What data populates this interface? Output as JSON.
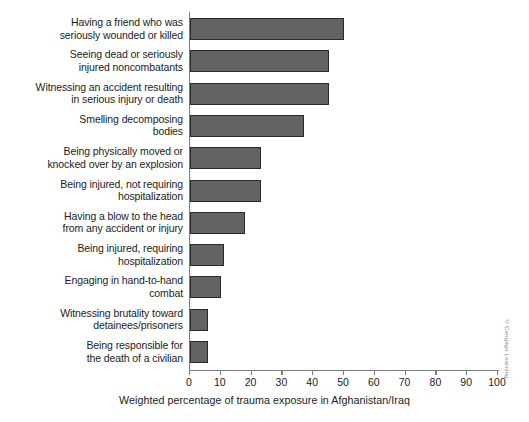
{
  "chart_data": {
    "type": "bar",
    "orientation": "horizontal",
    "title": "",
    "xlabel": "Weighted percentage of trauma exposure in Afghanistan/Iraq",
    "ylabel": "",
    "xlim": [
      0,
      100
    ],
    "xticks": [
      0,
      10,
      20,
      30,
      40,
      50,
      60,
      70,
      80,
      90,
      100
    ],
    "xtick_labels": [
      "0",
      "10",
      "20",
      "30",
      "40",
      "50",
      "60",
      "70",
      "80",
      "90",
      "100"
    ],
    "grid": false,
    "legend": null,
    "bar_color": "#636363",
    "bar_edge_color": "#2a2a2a",
    "axis_color": "#7d7d7d",
    "categories": [
      "Having a friend who was\nseriously wounded or killed",
      "Seeing dead or seriously\ninjured noncombatants",
      "Witnessing an accident resulting\nin serious injury or death",
      "Smelling decomposing\nbodies",
      "Being physically moved or\nknocked over by an explosion",
      "Being injured, not requiring\nhospitalization",
      "Having a blow to the head\nfrom any accident or injury",
      "Being injured, requiring\nhospitalization",
      "Engaging in hand-to-hand\ncombat",
      "Witnessing brutality toward\ndetainees/prisoners",
      "Being responsible for\nthe death of a civilian"
    ],
    "values": [
      50,
      45,
      45,
      37,
      23,
      23,
      18,
      11,
      10,
      6,
      6
    ]
  },
  "credit": {
    "text": "© Cengage Learning"
  }
}
